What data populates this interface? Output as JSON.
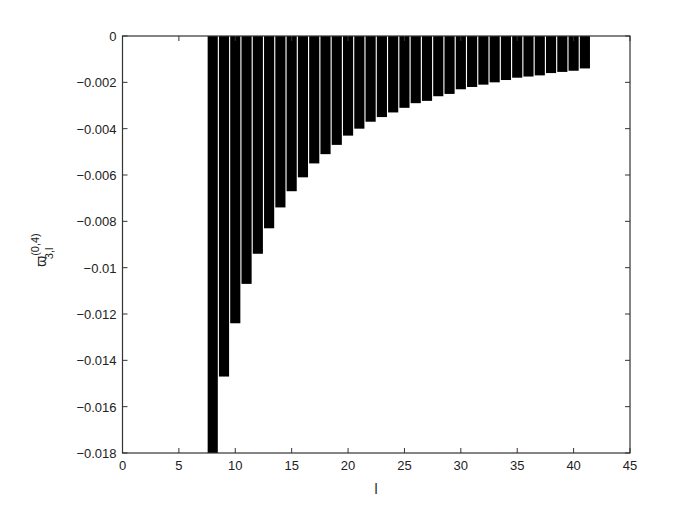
{
  "chart_data": {
    "type": "bar",
    "title": "",
    "xlabel": "l",
    "ylabel": "ϖ_{3,l}^{(0,4)}",
    "ylabel_parts": {
      "base": "ϖ",
      "superscript": "(0,4)",
      "subscript": "3,l"
    },
    "xlim": [
      0,
      45
    ],
    "ylim": [
      -0.018,
      0
    ],
    "xticks": [
      0,
      5,
      10,
      15,
      20,
      25,
      30,
      35,
      40,
      45
    ],
    "xtick_labels": [
      "0",
      "5",
      "10",
      "15",
      "20",
      "25",
      "30",
      "35",
      "40",
      "45"
    ],
    "yticks": [
      0,
      -0.002,
      -0.004,
      -0.006,
      -0.008,
      -0.01,
      -0.012,
      -0.014,
      -0.016,
      -0.018
    ],
    "ytick_labels": [
      "0",
      "−0.002",
      "−0.004",
      "−0.006",
      "−0.008",
      "−0.01",
      "−0.012",
      "−0.014",
      "−0.016",
      "−0.018"
    ],
    "grid": false,
    "legend": null,
    "bar_color": "#000000",
    "bar_width": 0.9,
    "categories": [
      8,
      9,
      10,
      11,
      12,
      13,
      14,
      15,
      16,
      17,
      18,
      19,
      20,
      21,
      22,
      23,
      24,
      25,
      26,
      27,
      28,
      29,
      30,
      31,
      32,
      33,
      34,
      35,
      36,
      37,
      38,
      39,
      40,
      41
    ],
    "values": [
      -0.0185,
      -0.0147,
      -0.0124,
      -0.0107,
      -0.0094,
      -0.0083,
      -0.0074,
      -0.0067,
      -0.0061,
      -0.0055,
      -0.0051,
      -0.0047,
      -0.0043,
      -0.004,
      -0.0037,
      -0.0035,
      -0.0033,
      -0.0031,
      -0.0029,
      -0.0028,
      -0.0026,
      -0.0025,
      -0.0023,
      -0.0022,
      -0.0021,
      -0.002,
      -0.0019,
      -0.0018,
      -0.00175,
      -0.0017,
      -0.0016,
      -0.00155,
      -0.0015,
      -0.0014
    ]
  }
}
